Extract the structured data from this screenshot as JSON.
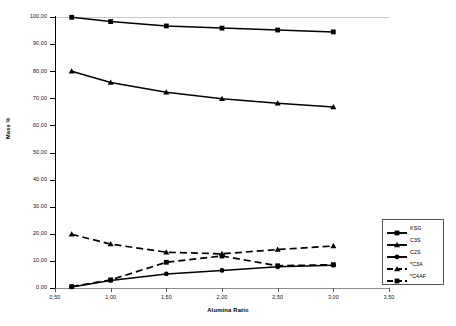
{
  "chart_data": {
    "type": "line",
    "title": "",
    "xlabel": "Alumina Ratio",
    "ylabel": "Mass %",
    "xlim": [
      0.5,
      3.5
    ],
    "ylim": [
      0,
      100
    ],
    "grid": false,
    "legend_position": "bottom-right",
    "decimal_separator": ",",
    "x": [
      0.65,
      1.0,
      1.5,
      2.0,
      2.5,
      3.0
    ],
    "xticks": [
      "0,50",
      "1,00",
      "1,50",
      "2,00",
      "2,50",
      "3,00",
      "3,50"
    ],
    "xtick_values": [
      0.5,
      1.0,
      1.5,
      2.0,
      2.5,
      3.0,
      3.5
    ],
    "yticks": [
      "0,00",
      "10,00",
      "20,00",
      "30,00",
      "40,00",
      "50,00",
      "60,00",
      "70,00",
      "80,00",
      "90,00",
      "100,00"
    ],
    "ytick_values": [
      0,
      10,
      20,
      30,
      40,
      50,
      60,
      70,
      80,
      90,
      100
    ],
    "series": [
      {
        "name": "KSG",
        "marker": "square",
        "line_style": "solid",
        "color": "#000000",
        "values": [
          99.9,
          98.3,
          96.7,
          95.9,
          95.2,
          94.5
        ]
      },
      {
        "name": "C3S",
        "marker": "triangle",
        "line_style": "solid",
        "color": "#000000",
        "values": [
          80.0,
          75.8,
          72.2,
          69.8,
          68.2,
          66.8
        ]
      },
      {
        "name": "C2S",
        "marker": "circle",
        "line_style": "solid",
        "color": "#000000",
        "values": [
          0.4,
          2.8,
          5.2,
          6.5,
          7.8,
          8.4
        ]
      },
      {
        "name": "*C3A",
        "marker": "triangle",
        "line_style": "dashed",
        "color": "#000000",
        "values": [
          19.8,
          16.2,
          13.2,
          12.6,
          14.2,
          15.5
        ]
      },
      {
        "name": "*C4AF",
        "marker": "square",
        "line_style": "dashed",
        "color": "#000000",
        "values": [
          0.5,
          3.0,
          9.5,
          11.8,
          8.2,
          8.6
        ]
      }
    ]
  }
}
